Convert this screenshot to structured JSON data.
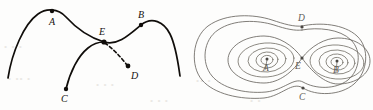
{
  "figure": {
    "background_color": "#fdfdfc",
    "ink_color_left": "#100d0a",
    "ink_color_right": "#6a6761",
    "watermark_color": "#e4e2dd"
  },
  "left_panel": {
    "name": "separatrix-crossing-diagram",
    "description": "Two smooth arcs crossing at E with a dashed branch to D",
    "labels": {
      "A": "A",
      "B": "B",
      "C": "C",
      "D": "D",
      "E": "E"
    },
    "points": [
      {
        "id": "A",
        "label": "A",
        "x": 52,
        "y": 11,
        "label_x": 49,
        "label_y": 24,
        "marked": true
      },
      {
        "id": "B",
        "label": "B",
        "x": 141,
        "y": 24,
        "label_x": 138,
        "label_y": 18,
        "marked": true
      },
      {
        "id": "C",
        "label": "C",
        "x": 66,
        "y": 89,
        "label_x": 62,
        "label_y": 101,
        "marked": true
      },
      {
        "id": "D",
        "label": "D",
        "x": 128,
        "y": 66,
        "label_x": 131,
        "label_y": 78,
        "marked": true
      },
      {
        "id": "E",
        "label": "E",
        "x": 104,
        "y": 42,
        "label_x": 100,
        "label_y": 35,
        "marked": true
      }
    ],
    "curve_upper": "solid arc rising from lower-left through A, descending through E and continuing up through B then down to the right",
    "curve_lower": "solid arc rising from C up to E",
    "curve_dashed": "dashed arc from E down-right to D"
  },
  "right_panel": {
    "name": "figure-eight-phase-portrait",
    "description": "Figure-eight separatrix with nested periodic orbits about two centers",
    "labels": {
      "A": "A",
      "B": "B",
      "C": "C",
      "D": "D",
      "E": "E"
    },
    "points": [
      {
        "id": "A",
        "label": "A",
        "x": 267,
        "y": 60,
        "label_x": 264,
        "label_y": 70,
        "marked": true,
        "role": "center"
      },
      {
        "id": "B",
        "label": "B",
        "x": 337,
        "y": 63,
        "label_x": 334,
        "label_y": 73,
        "marked": true,
        "role": "center"
      },
      {
        "id": "C",
        "label": "C",
        "x": 303,
        "y": 88,
        "label_x": 300,
        "label_y": 99,
        "marked": true,
        "role": "outer-orbit-point"
      },
      {
        "id": "D",
        "label": "D",
        "x": 301,
        "y": 26,
        "label_x": 299,
        "label_y": 20,
        "marked": true,
        "role": "outer-orbit-point"
      },
      {
        "id": "E",
        "label": "E",
        "x": 302,
        "y": 58,
        "label_x": 298,
        "label_y": 68,
        "marked": true,
        "role": "saddle"
      }
    ],
    "orbit_counts": {
      "outer_orbits": 2,
      "left_nested_orbits": 3,
      "right_nested_orbits": 3
    },
    "separatrix": "figure-eight crossing at saddle point E"
  },
  "watermark": {
    "visible": true,
    "note": "faint scanned background texture"
  }
}
